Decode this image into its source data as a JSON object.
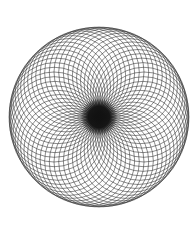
{
  "canvas": {
    "width": 191,
    "height": 229,
    "background_color": "#ffffff",
    "alt_text": "Spirograph rosette of overlapping circles"
  },
  "figure": {
    "name": "spirograph-rosette",
    "title": "Rosette of overlapping circles",
    "stroke_color": "#2b2b2b",
    "stroke_width": 0.55,
    "fill": "none",
    "center_x": 99,
    "center_y": 117,
    "envelope_radius": 90,
    "ring_radius": 45,
    "generator_radius": 45,
    "circle_count": 60,
    "core_color": "#111111",
    "core_radius": 13,
    "bounds": {
      "left": 9,
      "top": 27,
      "right": 189,
      "bottom": 212
    }
  },
  "chart_data": {
    "type": "scatter",
    "title": "Rosette of overlapping circles",
    "subtitle": "",
    "xlabel": "",
    "ylabel": "",
    "grid": false,
    "legend": false,
    "parameters": {
      "n_circles": 60,
      "circle_radius": 45,
      "center_locus_radius": 45,
      "angle_step_degrees": 6
    },
    "xlim": [
      9,
      189
    ],
    "ylim": [
      27,
      207
    ]
  }
}
